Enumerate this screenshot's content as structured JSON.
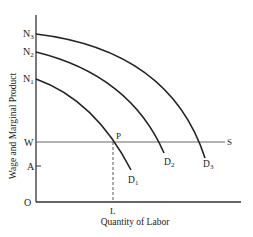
{
  "diagram": {
    "y_axis_label": "Wage and Marginal Product",
    "x_axis_label": "Quantity of Labor",
    "origin_label": "O",
    "y_ticks": {
      "N3": "N",
      "N3_sub": "3",
      "N2": "N",
      "N2_sub": "2",
      "N1": "N",
      "N1_sub": "1",
      "W": "W",
      "A": "A"
    },
    "x_ticks": {
      "L": "L"
    },
    "point_label": "P",
    "supply_label": "S",
    "curves": [
      {
        "name": "D",
        "sub": "1"
      },
      {
        "name": "D",
        "sub": "2"
      },
      {
        "name": "D",
        "sub": "3"
      }
    ],
    "colors": {
      "curve": "#222222",
      "axis": "#333333",
      "wage_line": "#555555"
    }
  }
}
